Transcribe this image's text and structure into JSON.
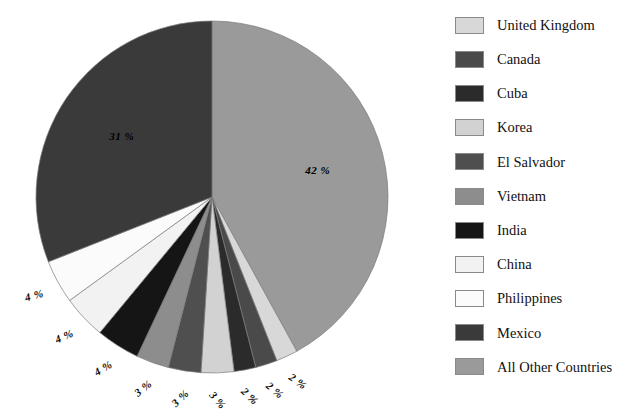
{
  "chart_data": {
    "type": "pie",
    "title": "",
    "subtitle": "",
    "xlabel": "",
    "ylabel": "",
    "legend_position": "right",
    "grid": false,
    "value_suffix": "%",
    "start_angle_deg": 0,
    "direction": "clockwise",
    "categories": [
      "All Other Countries",
      "United Kingdom",
      "Canada",
      "Cuba",
      "Korea",
      "El Salvador",
      "Vietnam",
      "India",
      "China",
      "Philippines",
      "Mexico"
    ],
    "values": [
      42,
      2,
      2,
      2,
      3,
      3,
      3,
      4,
      4,
      4,
      31
    ],
    "labels": [
      "42 %",
      "2 %",
      "2 %",
      "2 %",
      "3 %",
      "3 %",
      "3 %",
      "4 %",
      "4 %",
      "4 %",
      "31 %"
    ],
    "colors": [
      "#9a9a9a",
      "#d8d8d8",
      "#4a4a4a",
      "#2b2b2b",
      "#d2d2d2",
      "#4f4f4f",
      "#8d8d8d",
      "#151515",
      "#f2f2f2",
      "#fbfbfb",
      "#3a3a3a"
    ]
  },
  "legend": {
    "items": [
      {
        "label": "United Kingdom",
        "color": "#d8d8d8"
      },
      {
        "label": "Canada",
        "color": "#4a4a4a"
      },
      {
        "label": "Cuba",
        "color": "#2b2b2b"
      },
      {
        "label": "Korea",
        "color": "#d2d2d2"
      },
      {
        "label": "El Salvador",
        "color": "#4f4f4f"
      },
      {
        "label": "Vietnam",
        "color": "#8d8d8d"
      },
      {
        "label": "India",
        "color": "#151515"
      },
      {
        "label": "China",
        "color": "#f2f2f2"
      },
      {
        "label": "Philippines",
        "color": "#fbfbfb"
      },
      {
        "label": "Mexico",
        "color": "#3a3a3a"
      },
      {
        "label": "All Other Countries",
        "color": "#9a9a9a"
      }
    ]
  },
  "pie_geometry": {
    "center_x": 212,
    "center_y": 197,
    "radius": 176
  }
}
